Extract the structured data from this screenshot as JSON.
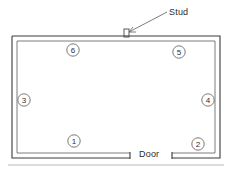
{
  "diagram": {
    "type": "floor-plan",
    "background_color": "#ffffff",
    "line_color": "#3a3a3a",
    "room": {
      "shape": "rectangle",
      "wall_style": "double-line"
    },
    "labels": {
      "stud": "Stud",
      "door": "Door"
    },
    "callouts": [
      {
        "id": 1,
        "label": "1",
        "wall": "bottom",
        "cx": 74,
        "cy": 141
      },
      {
        "id": 2,
        "label": "2",
        "wall": "bottom-right",
        "cx": 198,
        "cy": 144
      },
      {
        "id": 3,
        "label": "3",
        "wall": "left",
        "cx": 24,
        "cy": 100
      },
      {
        "id": 4,
        "label": "4",
        "wall": "right",
        "cx": 208,
        "cy": 100
      },
      {
        "id": 5,
        "label": "5",
        "wall": "top-right",
        "cx": 179,
        "cy": 52
      },
      {
        "id": 6,
        "label": "6",
        "wall": "top-left",
        "cx": 73,
        "cy": 50
      }
    ]
  }
}
